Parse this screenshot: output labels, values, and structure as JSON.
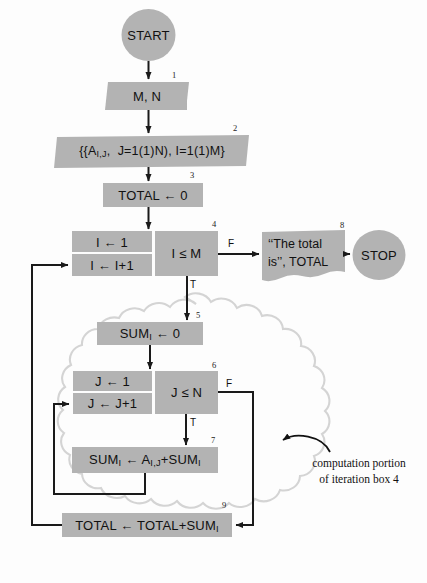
{
  "diagram": {
    "fill_color": "#b3b3b3",
    "line_color": "#1a1a1a",
    "background": "#fdfdfd",
    "cloud_color": "#d8d8d8"
  },
  "terminals": {
    "start": "START",
    "stop": "STOP"
  },
  "nodes": {
    "n1": {
      "number": "1",
      "text": "M, N",
      "shape": "parallelogram-input"
    },
    "n2": {
      "number": "2",
      "text": "{{A I,J, J=1(1)N), I=1(1)M}",
      "shape": "parallelogram-input"
    },
    "n3": {
      "number": "3",
      "text": "TOTAL ← 0",
      "shape": "rectangle"
    },
    "n4": {
      "number": "4",
      "shape": "iteration-box",
      "init": "I ← 1",
      "increment": "I ← I+1",
      "test": "I ≤ M",
      "true_label": "T",
      "false_label": "F"
    },
    "n5": {
      "number": "5",
      "text": "SUMᵢ ← 0",
      "shape": "rectangle"
    },
    "n6": {
      "number": "6",
      "shape": "iteration-box",
      "init": "J ← 1",
      "increment": "J ← J+1",
      "test": "J ≤ N",
      "true_label": "T",
      "false_label": "F"
    },
    "n7": {
      "number": "7",
      "text": "SUMᵢ ← Aᵢ,ⱼ+SUMᵢ",
      "shape": "rectangle"
    },
    "n8": {
      "number": "8",
      "text_line1": "‘‘The total",
      "text_line2": "is’’, TOTAL",
      "shape": "document"
    },
    "n9": {
      "number": "9",
      "text": "TOTAL ← TOTAL+SUMᵢ",
      "shape": "rectangle"
    }
  },
  "annotation": {
    "line1": "computation portion",
    "line2": "of iteration box 4",
    "arrow": "curved-arrow-left"
  },
  "labels": {
    "n4_true": "T",
    "n4_false": "F",
    "n6_true": "T",
    "n6_false": "F"
  }
}
